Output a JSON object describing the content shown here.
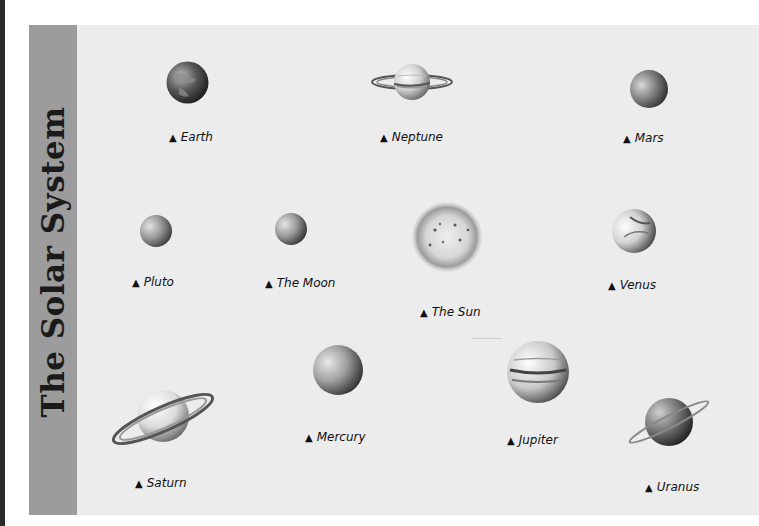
{
  "poster": {
    "title": "The Solar System",
    "bullet_glyph": "▲",
    "colors": {
      "background": "#ececec",
      "side_band": "#9c9c9c",
      "title_text": "#1a1a1a",
      "label_text": "#111111"
    }
  },
  "bodies": [
    {
      "name": "Earth",
      "label": "Earth"
    },
    {
      "name": "Neptune",
      "label": "Neptune"
    },
    {
      "name": "Mars",
      "label": "Mars"
    },
    {
      "name": "Pluto",
      "label": "Pluto"
    },
    {
      "name": "The Moon",
      "label": "The Moon"
    },
    {
      "name": "The Sun",
      "label": "The Sun"
    },
    {
      "name": "Venus",
      "label": "Venus"
    },
    {
      "name": "Saturn",
      "label": "Saturn"
    },
    {
      "name": "Mercury",
      "label": "Mercury"
    },
    {
      "name": "Jupiter",
      "label": "Jupiter"
    },
    {
      "name": "Uranus",
      "label": "Uranus"
    }
  ]
}
